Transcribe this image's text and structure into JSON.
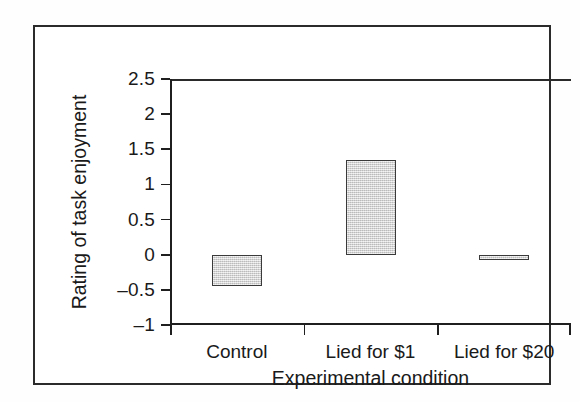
{
  "chart_data": {
    "type": "bar",
    "title": "",
    "subtitle": "",
    "xlabel": "Experimental condition",
    "ylabel": "Rating of task enjoyment",
    "categories": [
      "Control",
      "Lied for $1",
      "Lied for $20"
    ],
    "values": [
      -0.45,
      1.35,
      -0.07
    ],
    "series": [
      {
        "name": "Rating of task enjoyment",
        "values": [
          -0.45,
          1.35,
          -0.07
        ]
      }
    ],
    "ylim": [
      -1,
      2.5
    ],
    "ytick_values": [
      2.5,
      2,
      1.5,
      1,
      0.5,
      0,
      -0.5,
      -1
    ],
    "ytick_labels": [
      "2.5",
      "2",
      "1.5",
      "1",
      "0.5",
      "0",
      "–0.5",
      "–1"
    ],
    "grid": false,
    "legend": false,
    "legend_position": "none",
    "annotations": [],
    "bar_fill_color": "#d2d2d2",
    "bar_border_color": "#3a3a3a",
    "axis_color": "#1f1f1f",
    "background_color": "#ffffff",
    "frame_color": "#2b2b2b",
    "zero_line_value": 0
  }
}
